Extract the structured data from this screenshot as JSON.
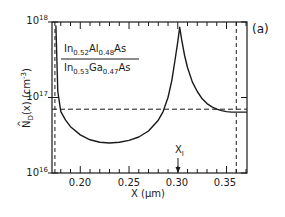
{
  "chart_data": {
    "type": "line",
    "title": "",
    "panel_label": "(a)",
    "xlabel": "X (μm)",
    "ylabel": "N̂_D(x) (cm^-3)",
    "ylabel_parts": {
      "main": "N",
      "sub": "D",
      "arg": "(x)",
      "unit": "(cm",
      "unit_exp": "-3",
      "unit_close": ")"
    },
    "yscale": "log",
    "xlim": [
      0.171,
      0.371
    ],
    "ylim": [
      1e+16,
      1e+18
    ],
    "x_ticks": [
      {
        "value": 0.2,
        "label": "0.20"
      },
      {
        "value": 0.25,
        "label": "0.25"
      },
      {
        "value": 0.3,
        "label": "0.30"
      },
      {
        "value": 0.35,
        "label": "0.35"
      }
    ],
    "y_ticks": [
      {
        "value": 1e+16,
        "base": "10",
        "exp": "16"
      },
      {
        "value": 1e+17,
        "base": "10",
        "exp": "17"
      },
      {
        "value": 1e+18,
        "base": "10",
        "exp": "18"
      }
    ],
    "grid": false,
    "legend": {
      "position": "upper-left",
      "top_material": {
        "parts": [
          "In",
          "0.52",
          "Al",
          "0.48",
          "As"
        ]
      },
      "bottom_material": {
        "parts": [
          "In",
          "0.53",
          "Ga",
          "0.47",
          "As"
        ]
      }
    },
    "reference_lines": {
      "horizontal_dashed_y": 7e+16,
      "vertical_dashed_x": [
        0.174,
        0.36
      ]
    },
    "annotations": [
      {
        "text": "X",
        "sub": "I",
        "x": 0.302,
        "type": "arrow-down"
      }
    ],
    "series": [
      {
        "name": "N_D(x)",
        "style": "solid",
        "x": [
          0.175,
          0.177,
          0.18,
          0.185,
          0.19,
          0.2,
          0.21,
          0.22,
          0.23,
          0.24,
          0.25,
          0.26,
          0.27,
          0.28,
          0.285,
          0.29,
          0.294,
          0.297,
          0.3,
          0.302,
          0.304,
          0.307,
          0.31,
          0.315,
          0.32,
          0.325,
          0.33,
          0.335,
          0.34,
          0.345,
          0.35,
          0.355,
          0.36,
          0.365,
          0.371
        ],
        "y": [
          9e+17,
          1.2e+17,
          6.5e+16,
          5e+16,
          4.1e+16,
          3.2e+16,
          2.75e+16,
          2.55e+16,
          2.5e+16,
          2.55e+16,
          2.7e+16,
          3e+16,
          3.6e+16,
          5e+16,
          6.5e+16,
          1e+17,
          1.7e+17,
          3e+17,
          5.5e+17,
          8.5e+17,
          5.8e+17,
          3.6e+17,
          2.5e+17,
          1.6e+17,
          1.2e+17,
          9.6e+16,
          8.3e+16,
          7.5e+16,
          7e+16,
          6.7e+16,
          6.5e+16,
          6.4e+16,
          6.4e+16,
          6.4e+16,
          6.4e+16
        ]
      }
    ]
  }
}
